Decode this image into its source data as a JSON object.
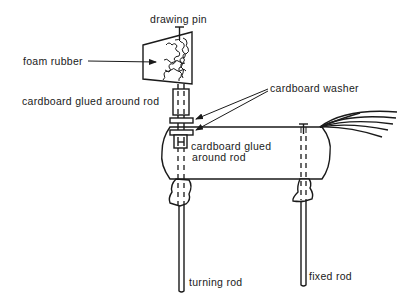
{
  "diagram": {
    "labels": {
      "drawing_pin": "drawing pin",
      "foam_rubber": "foam rubber",
      "cardboard_upper": "cardboard glued around rod",
      "cardboard_washer": "cardboard washer",
      "cardboard_lower_line1": "cardboard glued",
      "cardboard_lower_line2": "around rod",
      "turning_rod": "turning rod",
      "fixed_rod": "fixed rod"
    },
    "parts": [
      {
        "id": "drawing-pin",
        "label": "drawing pin"
      },
      {
        "id": "flag-head",
        "label": "foam rubber"
      },
      {
        "id": "upper-sleeve",
        "label": "cardboard glued around rod"
      },
      {
        "id": "washers",
        "label": "cardboard washer",
        "count": 2
      },
      {
        "id": "lower-sleeve",
        "label": "cardboard glued around rod"
      },
      {
        "id": "body",
        "label": ""
      },
      {
        "id": "tail",
        "label": ""
      },
      {
        "id": "turning-rod",
        "label": "turning rod"
      },
      {
        "id": "fixed-rod",
        "label": "fixed rod"
      }
    ],
    "colors": {
      "ink": "#1a1a1a",
      "paper": "#ffffff"
    }
  }
}
